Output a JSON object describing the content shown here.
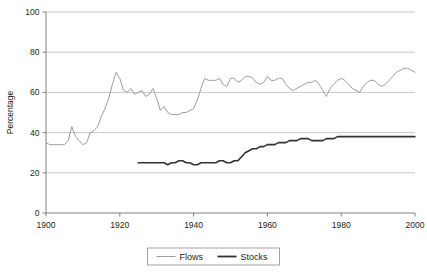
{
  "chart_data": {
    "type": "line",
    "title": "",
    "xlabel": "",
    "ylabel": "Percentage",
    "xlim": [
      1900,
      2000
    ],
    "ylim": [
      0,
      100
    ],
    "xticks": [
      1900,
      1920,
      1940,
      1960,
      1980,
      2000
    ],
    "yticks": [
      0,
      20,
      40,
      60,
      80,
      100
    ],
    "grid": "horizontal",
    "legend_position": "bottom-center",
    "series": [
      {
        "name": "Flows",
        "color": "#9d9d9d",
        "x": [
          1900,
          1901,
          1902,
          1903,
          1904,
          1905,
          1906,
          1907,
          1908,
          1909,
          1910,
          1911,
          1912,
          1913,
          1914,
          1915,
          1916,
          1917,
          1918,
          1919,
          1920,
          1921,
          1922,
          1923,
          1924,
          1925,
          1926,
          1927,
          1928,
          1929,
          1930,
          1931,
          1932,
          1933,
          1934,
          1935,
          1936,
          1937,
          1938,
          1939,
          1940,
          1941,
          1942,
          1943,
          1944,
          1945,
          1946,
          1947,
          1948,
          1949,
          1950,
          1951,
          1952,
          1953,
          1954,
          1955,
          1956,
          1957,
          1958,
          1959,
          1960,
          1961,
          1962,
          1963,
          1964,
          1965,
          1966,
          1967,
          1968,
          1969,
          1970,
          1971,
          1972,
          1973,
          1974,
          1975,
          1976,
          1977,
          1978,
          1979,
          1980,
          1981,
          1982,
          1983,
          1984,
          1985,
          1986,
          1987,
          1988,
          1989,
          1990,
          1991,
          1992,
          1993,
          1994,
          1995,
          1996,
          1997,
          1998,
          1999,
          2000
        ],
        "values": [
          35,
          34,
          34,
          34,
          34,
          34,
          36,
          43,
          38,
          36,
          34,
          35,
          40,
          41,
          43,
          48,
          52,
          57,
          64,
          70,
          67,
          61,
          60,
          62,
          59,
          60,
          61,
          58,
          59,
          62,
          57,
          51,
          53,
          50,
          49,
          49,
          49,
          50,
          50,
          51,
          52,
          56,
          62,
          67,
          66,
          66,
          66,
          67,
          64,
          63,
          67,
          67,
          65,
          66,
          68,
          68,
          67,
          65,
          64,
          65,
          68,
          66,
          66,
          67,
          67,
          64,
          62,
          61,
          62,
          63,
          64,
          65,
          65,
          66,
          64,
          61,
          58,
          62,
          64,
          66,
          67,
          66,
          64,
          62,
          61,
          60,
          63,
          65,
          66,
          66,
          64,
          63,
          64,
          66,
          68,
          70,
          71,
          72,
          72,
          71,
          70
        ]
      },
      {
        "name": "Stocks",
        "color": "#333333",
        "x": [
          1925,
          1926,
          1927,
          1928,
          1929,
          1930,
          1931,
          1932,
          1933,
          1934,
          1935,
          1936,
          1937,
          1938,
          1939,
          1940,
          1941,
          1942,
          1943,
          1944,
          1945,
          1946,
          1947,
          1948,
          1949,
          1950,
          1951,
          1952,
          1953,
          1954,
          1955,
          1956,
          1957,
          1958,
          1959,
          1960,
          1961,
          1962,
          1963,
          1964,
          1965,
          1966,
          1967,
          1968,
          1969,
          1970,
          1971,
          1972,
          1973,
          1974,
          1975,
          1976,
          1977,
          1978,
          1979,
          1980,
          1981,
          1982,
          1983,
          1984,
          1985,
          1986,
          1987,
          1988,
          1989,
          1990,
          1991,
          1992,
          1993,
          1994,
          1995,
          1996,
          1997,
          1998,
          1999,
          2000
        ],
        "values": [
          25,
          25,
          25,
          25,
          25,
          25,
          25,
          25,
          24,
          25,
          25,
          26,
          26,
          25,
          25,
          24,
          24,
          25,
          25,
          25,
          25,
          25,
          26,
          26,
          25,
          25,
          26,
          26,
          28,
          30,
          31,
          32,
          32,
          33,
          33,
          34,
          34,
          34,
          35,
          35,
          35,
          36,
          36,
          36,
          37,
          37,
          37,
          36,
          36,
          36,
          36,
          37,
          37,
          37,
          38,
          38,
          38,
          38,
          38,
          38,
          38,
          38,
          38,
          38,
          38,
          38,
          38,
          38,
          38,
          38,
          38,
          38,
          38,
          38,
          38,
          38
        ]
      }
    ]
  },
  "legend": {
    "items": [
      {
        "label": "Flows",
        "color": "#9d9d9d",
        "width": 1
      },
      {
        "label": "Stocks",
        "color": "#333333",
        "width": 2
      }
    ]
  },
  "axes": {
    "y_title": "Percentage"
  }
}
